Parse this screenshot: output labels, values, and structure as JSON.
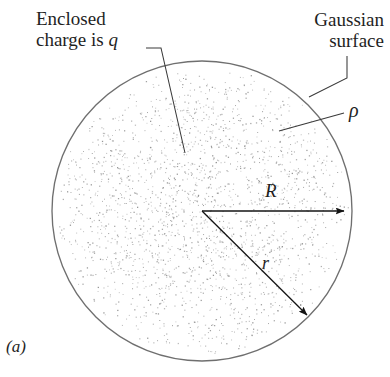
{
  "figure": {
    "panel_label": "(a)",
    "caption_labels": {
      "enclosed_charge_line1": "Enclosed",
      "enclosed_charge_line2": "charge is ",
      "enclosed_charge_symbol": "q",
      "gaussian_surface_line1": "Gaussian",
      "gaussian_surface_line2": "surface",
      "charge_density_symbol": "ρ",
      "radius_symbol": "R",
      "distance_symbol": "r"
    },
    "colors": {
      "outline": "#6f6f6f",
      "stipple": "#8c8c8c",
      "leader": "#3a3a3a",
      "arrow": "#1a1a1a",
      "text": "#1f1f1f",
      "background": "#ffffff"
    }
  },
  "chart_data": {
    "type": "diagram",
    "sphere": {
      "center_x": 202,
      "center_y": 211,
      "radius_px": 150,
      "label": "R",
      "stipple_point_count": 2100,
      "stipple_description": "uniform volume charge density rendered as dots, denser near center in 2D projection"
    },
    "vectors": [
      {
        "name": "R",
        "label": "R",
        "from": [
          202,
          211
        ],
        "to": [
          348,
          211
        ],
        "angle_deg": 0,
        "description": "radius of the charged sphere, horizontal arrow to the right"
      },
      {
        "name": "r",
        "label": "r",
        "from": [
          202,
          211
        ],
        "to": [
          311,
          319
        ],
        "angle_deg": -44.7,
        "description": "radial distance to the Gaussian surface, diagonal arrow down-right"
      }
    ],
    "leaders": [
      {
        "name": "enclosed-charge-leader",
        "label": "Enclosed charge is q",
        "path": [
          [
            146,
            48
          ],
          [
            161,
            48
          ],
          [
            185,
            153
          ]
        ]
      },
      {
        "name": "gaussian-surface-leader",
        "label": "Gaussian surface",
        "path": [
          [
            347,
            56
          ],
          [
            347,
            78
          ],
          [
            309,
            97
          ]
        ]
      },
      {
        "name": "rho-leader",
        "label": "ρ",
        "path": [
          [
            344,
            113
          ],
          [
            279,
            131
          ]
        ]
      }
    ],
    "annotations": [
      "Enclosed charge is q",
      "Gaussian surface",
      "ρ",
      "R",
      "r",
      "(a)"
    ],
    "grid": false,
    "legend": "none"
  }
}
